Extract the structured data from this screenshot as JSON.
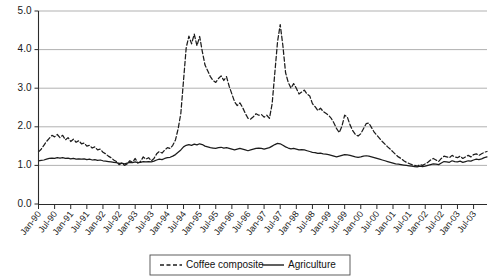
{
  "chart_data": {
    "type": "line",
    "title": "",
    "xlabel": "",
    "ylabel": "",
    "ylim": [
      0.0,
      5.0
    ],
    "yticks": [
      0.0,
      1.0,
      2.0,
      3.0,
      4.0,
      5.0
    ],
    "ytick_labels": [
      "0.0",
      "1.0",
      "2.0",
      "3.0",
      "4.0",
      "5.0"
    ],
    "grid": true,
    "legend_position": "bottom-center",
    "xtick_labels": [
      "Jan-90",
      "Jul-90",
      "Jan-91",
      "Jul-91",
      "Jan-92",
      "Jul-92",
      "Jan-93",
      "Jul-93",
      "Jan-94",
      "Jul-94",
      "Jan-95",
      "Jul-95",
      "Jan-96",
      "Jul-96",
      "Jan-97",
      "Jul-97",
      "Jan-98",
      "Jul-98",
      "Jan-99",
      "Jul-99",
      "Jan-00",
      "Jul-00",
      "Jan-01",
      "Jul-01",
      "Jan-02",
      "Jul-02",
      "Jan-03",
      "Jul-03"
    ],
    "x": [
      "1990-01",
      "1990-02",
      "1990-03",
      "1990-04",
      "1990-05",
      "1990-06",
      "1990-07",
      "1990-08",
      "1990-09",
      "1990-10",
      "1990-11",
      "1990-12",
      "1991-01",
      "1991-02",
      "1991-03",
      "1991-04",
      "1991-05",
      "1991-06",
      "1991-07",
      "1991-08",
      "1991-09",
      "1991-10",
      "1991-11",
      "1991-12",
      "1992-01",
      "1992-02",
      "1992-03",
      "1992-04",
      "1992-05",
      "1992-06",
      "1992-07",
      "1992-08",
      "1992-09",
      "1992-10",
      "1992-11",
      "1992-12",
      "1993-01",
      "1993-02",
      "1993-03",
      "1993-04",
      "1993-05",
      "1993-06",
      "1993-07",
      "1993-08",
      "1993-09",
      "1993-10",
      "1993-11",
      "1993-12",
      "1994-01",
      "1994-02",
      "1994-03",
      "1994-04",
      "1994-05",
      "1994-06",
      "1994-07",
      "1994-08",
      "1994-09",
      "1994-10",
      "1994-11",
      "1994-12",
      "1995-01",
      "1995-02",
      "1995-03",
      "1995-04",
      "1995-05",
      "1995-06",
      "1995-07",
      "1995-08",
      "1995-09",
      "1995-10",
      "1995-11",
      "1995-12",
      "1996-01",
      "1996-02",
      "1996-03",
      "1996-04",
      "1996-05",
      "1996-06",
      "1996-07",
      "1996-08",
      "1996-09",
      "1996-10",
      "1996-11",
      "1996-12",
      "1997-01",
      "1997-02",
      "1997-03",
      "1997-04",
      "1997-05",
      "1997-06",
      "1997-07",
      "1997-08",
      "1997-09",
      "1997-10",
      "1997-11",
      "1997-12",
      "1998-01",
      "1998-02",
      "1998-03",
      "1998-04",
      "1998-05",
      "1998-06",
      "1998-07",
      "1998-08",
      "1998-09",
      "1998-10",
      "1998-11",
      "1998-12",
      "1999-01",
      "1999-02",
      "1999-03",
      "1999-04",
      "1999-05",
      "1999-06",
      "1999-07",
      "1999-08",
      "1999-09",
      "1999-10",
      "1999-11",
      "1999-12",
      "2000-01",
      "2000-02",
      "2000-03",
      "2000-04",
      "2000-05",
      "2000-06",
      "2000-07",
      "2000-08",
      "2000-09",
      "2000-10",
      "2000-11",
      "2000-12",
      "2001-01",
      "2001-02",
      "2001-03",
      "2001-04",
      "2001-05",
      "2001-06",
      "2001-07",
      "2001-08",
      "2001-09",
      "2001-10",
      "2001-11",
      "2001-12",
      "2002-01",
      "2002-02",
      "2002-03",
      "2002-04",
      "2002-05",
      "2002-06",
      "2002-07",
      "2002-08",
      "2002-09",
      "2002-10",
      "2002-11",
      "2002-12",
      "2003-01",
      "2003-02",
      "2003-03",
      "2003-04",
      "2003-05",
      "2003-06",
      "2003-07",
      "2003-08",
      "2003-09",
      "2003-10",
      "2003-11",
      "2003-12"
    ],
    "series": [
      {
        "name": "Coffee composite",
        "style": "dashed",
        "color": "#1c1c1c",
        "values": [
          1.35,
          1.42,
          1.52,
          1.62,
          1.7,
          1.78,
          1.74,
          1.8,
          1.72,
          1.78,
          1.66,
          1.72,
          1.62,
          1.68,
          1.6,
          1.64,
          1.56,
          1.58,
          1.5,
          1.52,
          1.45,
          1.48,
          1.4,
          1.42,
          1.34,
          1.3,
          1.24,
          1.2,
          1.14,
          1.1,
          1.02,
          1.06,
          1.0,
          1.04,
          1.12,
          1.08,
          1.18,
          1.06,
          1.1,
          1.22,
          1.16,
          1.2,
          1.12,
          1.18,
          1.3,
          1.36,
          1.32,
          1.4,
          1.46,
          1.44,
          1.52,
          1.66,
          1.95,
          2.35,
          3.2,
          4.05,
          4.35,
          4.15,
          4.4,
          4.1,
          4.34,
          3.95,
          3.6,
          3.45,
          3.3,
          3.2,
          3.15,
          3.25,
          3.32,
          3.2,
          3.3,
          3.05,
          2.85,
          2.65,
          2.55,
          2.62,
          2.5,
          2.35,
          2.22,
          2.2,
          2.26,
          2.34,
          2.3,
          2.32,
          2.25,
          2.3,
          2.22,
          2.6,
          3.4,
          4.2,
          4.65,
          4.1,
          3.4,
          3.15,
          3.0,
          3.12,
          3.0,
          2.85,
          2.9,
          2.95,
          2.85,
          2.8,
          2.6,
          2.52,
          2.42,
          2.48,
          2.4,
          2.35,
          2.3,
          2.22,
          2.1,
          1.95,
          1.85,
          2.02,
          2.3,
          2.25,
          2.05,
          1.9,
          1.8,
          1.76,
          1.82,
          1.95,
          2.08,
          2.1,
          1.98,
          1.86,
          1.78,
          1.7,
          1.62,
          1.55,
          1.48,
          1.42,
          1.35,
          1.28,
          1.22,
          1.18,
          1.12,
          1.08,
          1.05,
          1.02,
          1.0,
          0.98,
          1.02,
          1.0,
          1.04,
          1.08,
          1.14,
          1.18,
          1.14,
          1.1,
          1.18,
          1.24,
          1.22,
          1.2,
          1.26,
          1.22,
          1.2,
          1.24,
          1.18,
          1.22,
          1.26,
          1.22,
          1.28,
          1.3,
          1.26,
          1.3,
          1.34,
          1.36
        ]
      },
      {
        "name": "Agriculture",
        "style": "solid",
        "color": "#1c1c1c",
        "values": [
          1.12,
          1.13,
          1.14,
          1.16,
          1.18,
          1.19,
          1.18,
          1.2,
          1.19,
          1.2,
          1.18,
          1.19,
          1.17,
          1.18,
          1.16,
          1.17,
          1.16,
          1.17,
          1.15,
          1.16,
          1.14,
          1.15,
          1.13,
          1.14,
          1.12,
          1.11,
          1.1,
          1.09,
          1.08,
          1.07,
          1.05,
          1.06,
          1.04,
          1.06,
          1.08,
          1.07,
          1.09,
          1.07,
          1.08,
          1.1,
          1.09,
          1.1,
          1.09,
          1.11,
          1.14,
          1.16,
          1.15,
          1.18,
          1.2,
          1.21,
          1.24,
          1.28,
          1.34,
          1.4,
          1.48,
          1.52,
          1.54,
          1.52,
          1.55,
          1.53,
          1.56,
          1.54,
          1.5,
          1.48,
          1.46,
          1.45,
          1.44,
          1.46,
          1.47,
          1.45,
          1.46,
          1.44,
          1.42,
          1.4,
          1.42,
          1.44,
          1.42,
          1.4,
          1.38,
          1.4,
          1.42,
          1.44,
          1.45,
          1.44,
          1.42,
          1.44,
          1.46,
          1.5,
          1.54,
          1.57,
          1.56,
          1.52,
          1.48,
          1.45,
          1.43,
          1.44,
          1.42,
          1.4,
          1.41,
          1.4,
          1.38,
          1.36,
          1.34,
          1.33,
          1.31,
          1.32,
          1.3,
          1.29,
          1.28,
          1.26,
          1.24,
          1.22,
          1.24,
          1.26,
          1.28,
          1.27,
          1.26,
          1.24,
          1.22,
          1.21,
          1.22,
          1.24,
          1.25,
          1.24,
          1.22,
          1.2,
          1.18,
          1.16,
          1.14,
          1.12,
          1.1,
          1.08,
          1.06,
          1.04,
          1.03,
          1.02,
          1.01,
          1.0,
          0.99,
          0.98,
          0.97,
          0.96,
          0.98,
          0.97,
          0.98,
          1.0,
          1.02,
          1.04,
          1.03,
          1.02,
          1.06,
          1.1,
          1.09,
          1.08,
          1.12,
          1.1,
          1.09,
          1.11,
          1.08,
          1.1,
          1.12,
          1.11,
          1.14,
          1.16,
          1.15,
          1.17,
          1.2,
          1.22
        ]
      }
    ],
    "legend": [
      {
        "label": "Coffee composite",
        "style": "dashed"
      },
      {
        "label": "Agriculture",
        "style": "solid"
      }
    ]
  }
}
